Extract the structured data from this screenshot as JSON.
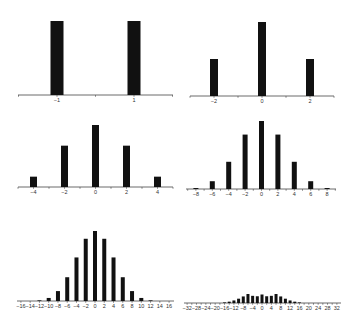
{
  "chart_data": [
    {
      "type": "bar",
      "panel": 1,
      "x": [
        -1,
        1
      ],
      "values": [
        0.5,
        0.5
      ],
      "tick_labels": [
        "-1",
        "1"
      ],
      "xlim": [
        -2,
        2
      ],
      "title": "",
      "xlabel": "",
      "ylabel": ""
    },
    {
      "type": "bar",
      "panel": 2,
      "x": [
        -2,
        0,
        2
      ],
      "values": [
        0.25,
        0.5,
        0.25
      ],
      "tick_labels": [
        "-2",
        "0",
        "2"
      ],
      "xlim": [
        -3,
        3
      ],
      "title": "",
      "xlabel": "",
      "ylabel": ""
    },
    {
      "type": "bar",
      "panel": 3,
      "x": [
        -4,
        -2,
        0,
        2,
        4
      ],
      "values": [
        0.0625,
        0.25,
        0.375,
        0.25,
        0.0625
      ],
      "tick_labels": [
        "-4",
        "-2",
        "0",
        "2",
        "4"
      ],
      "xlim": [
        -5,
        5
      ],
      "title": "",
      "xlabel": "",
      "ylabel": ""
    },
    {
      "type": "bar",
      "panel": 4,
      "x": [
        -8,
        -6,
        -4,
        -2,
        0,
        2,
        4,
        6,
        8
      ],
      "values": [
        0.0039,
        0.0313,
        0.1094,
        0.2188,
        0.2734,
        0.2188,
        0.1094,
        0.0313,
        0.0039
      ],
      "tick_labels": [
        "-8",
        "-6",
        "-4",
        "-2",
        "0",
        "2",
        "4",
        "6",
        "8"
      ],
      "xlim": [
        -9,
        9
      ],
      "title": "",
      "xlabel": "",
      "ylabel": ""
    },
    {
      "type": "bar",
      "panel": 5,
      "x": [
        -16,
        -14,
        -12,
        -10,
        -8,
        -6,
        -4,
        -2,
        0,
        2,
        4,
        6,
        8,
        10,
        12,
        14,
        16
      ],
      "values": [
        1.53e-05,
        0.000244,
        0.00183,
        0.00854,
        0.0278,
        0.0667,
        0.1222,
        0.1746,
        0.1964,
        0.1746,
        0.1222,
        0.0667,
        0.0278,
        0.00854,
        0.00183,
        0.000244,
        1.53e-05
      ],
      "tick_labels": [
        "-16",
        "-14",
        "-12",
        "-10",
        "-8",
        "-6",
        "-4",
        "-2",
        "0",
        "2",
        "4",
        "6",
        "8",
        "10",
        "12",
        "14",
        "16"
      ],
      "xlim": [
        -17,
        17
      ],
      "title": "",
      "xlabel": "",
      "ylabel": ""
    },
    {
      "type": "bar",
      "panel": 6,
      "x": [
        -32,
        -30,
        -28,
        -26,
        -24,
        -22,
        -20,
        -18,
        -16,
        -14,
        -12,
        -10,
        -8,
        -6,
        -4,
        -2,
        0,
        2,
        4,
        6,
        8,
        10,
        12,
        14,
        16,
        18,
        20,
        22,
        24,
        26,
        28,
        30,
        32
      ],
      "values": [
        2e-10,
        7.5e-09,
        1.2e-07,
        1.1e-06,
        7.4e-06,
        3.5e-05,
        0.00013,
        0.0004,
        0.001,
        0.0022,
        0.0042,
        0.0071,
        0.0108,
        0.0148,
        0.0118,
        0.0111,
        0.014,
        0.0111,
        0.0118,
        0.0148,
        0.0108,
        0.0071,
        0.0042,
        0.0022,
        0.001,
        0.0004,
        0.00013,
        3.5e-05,
        7.4e-06,
        1.1e-06,
        1.2e-07,
        7.5e-09,
        2e-10
      ],
      "tick_labels": [
        "-32",
        "-28",
        "-24",
        "-20",
        "-16",
        "-12",
        "-8",
        "-4",
        "0",
        "4",
        "8",
        "12",
        "16",
        "20",
        "24",
        "28",
        "32"
      ],
      "xlim": [
        -33,
        33
      ],
      "title": "",
      "xlabel": "",
      "ylabel": "",
      "note": "Symmetric binomial-like distribution over 32 steps, peak at 0"
    }
  ],
  "panels": [
    {
      "axis_x0": 18,
      "axis_x1": 173,
      "axis_y": 95,
      "center_x": 95.5,
      "unit_px": 38.5,
      "bar_w": 13,
      "peak_h": 74,
      "peak_val": 0.5,
      "label_y": 102,
      "tick_step": 1,
      "label_step": 2,
      "label_start": -1
    },
    {
      "axis_x0": 190,
      "axis_x1": 334,
      "axis_y": 96,
      "center_x": 262,
      "unit_px": 24,
      "bar_w": 8,
      "peak_h": 74,
      "peak_val": 0.5,
      "label_y": 103,
      "tick_step": 1,
      "label_step": 2,
      "label_start": -2
    },
    {
      "axis_x0": 18,
      "axis_x1": 173,
      "axis_y": 187,
      "center_x": 95.5,
      "unit_px": 15.5,
      "bar_w": 7,
      "peak_h": 62,
      "peak_val": 0.375,
      "label_y": 194,
      "tick_step": 1,
      "label_step": 2,
      "label_start": -4
    },
    {
      "axis_x0": 186,
      "axis_x1": 336,
      "axis_y": 189,
      "center_x": 261.5,
      "unit_px": 8.2,
      "bar_w": 5,
      "peak_h": 68,
      "peak_val": 0.2734,
      "label_y": 196,
      "tick_step": 1,
      "label_step": 2,
      "label_start": -8
    },
    {
      "axis_x0": 17,
      "axis_x1": 174,
      "axis_y": 301,
      "center_x": 95,
      "unit_px": 4.63,
      "bar_w": 4,
      "peak_h": 70,
      "peak_val": 0.1964,
      "label_y": 308,
      "tick_step": 2,
      "label_step": 2,
      "label_start": -16
    },
    {
      "axis_x0": 184,
      "axis_x1": 341,
      "axis_y": 303,
      "center_x": 262,
      "unit_px": 2.34,
      "bar_w": 3,
      "peak_h": 85,
      "peak_val": 0.14,
      "label_y": 310,
      "tick_step": 2,
      "label_step": 4,
      "label_start": -32
    }
  ]
}
